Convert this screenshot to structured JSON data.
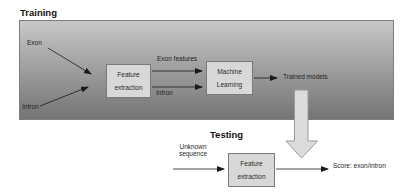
{
  "training": {
    "section_label": "Training",
    "exon_label": "Exon",
    "intron_label": "Intron",
    "feature_box": {
      "line1": "Feature",
      "line2": "extraction"
    },
    "exon_features_arrow_label": "Exon features",
    "intron_arrow_label": "Intron",
    "machine_learning_box": {
      "line1": "Machine",
      "line2": "Learning"
    },
    "trained_models_label": "Trained models"
  },
  "testing": {
    "section_label": "Testing",
    "unknown_sequence": {
      "line1": "Unknown",
      "line2": "sequence"
    },
    "feature_box": {
      "line1": "Feature",
      "line2": "extraction"
    },
    "score_label": "Score: exon/intron"
  },
  "colors": {
    "panel_gradient_top": "#c7c7c7",
    "panel_gradient_bottom": "#747474",
    "panel_border": "#7d7d7d",
    "box_fill": "#d8d8d8",
    "box_border": "#7a7a7a",
    "block_arrow_fill": "#dcdcdc",
    "block_arrow_border": "#9a9a9a",
    "arrow_color": "#1a1a1a",
    "text_color": "#1f1f1f"
  }
}
